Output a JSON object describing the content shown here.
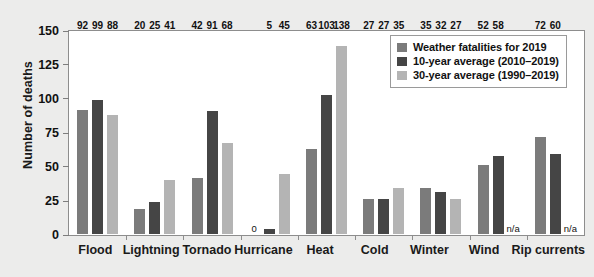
{
  "chart_data": {
    "type": "bar",
    "title": "",
    "xlabel": "",
    "ylabel": "Number of deaths",
    "ylim": [
      0,
      150
    ],
    "yticks": [
      0,
      25,
      50,
      75,
      100,
      125,
      150
    ],
    "grid": false,
    "legend_position": "top-right",
    "categories": [
      "Flood",
      "Lightning",
      "Tornado",
      "Hurricane",
      "Heat",
      "Cold",
      "Winter",
      "Wind",
      "Rip currents"
    ],
    "series": [
      {
        "name": "Weather fatalities for 2019",
        "color": "#7b7b7b",
        "values": [
          92,
          20,
          42,
          0,
          63,
          27,
          35,
          52,
          72
        ],
        "labels": [
          "92",
          "20",
          "42",
          "0",
          "63",
          "27",
          "35",
          "52",
          "72"
        ]
      },
      {
        "name": "10-year average (2010–2019)",
        "color": "#454545",
        "values": [
          99,
          25,
          91,
          5,
          103,
          27,
          32,
          58,
          60
        ],
        "labels": [
          "99",
          "25",
          "91",
          "5",
          "103",
          "27",
          "32",
          "58",
          "60"
        ]
      },
      {
        "name": "30-year average (1990–2019)",
        "color": "#b4b4b4",
        "values": [
          88,
          41,
          68,
          45,
          138,
          35,
          27,
          null,
          null
        ],
        "labels": [
          "88",
          "41",
          "68",
          "45",
          "138",
          "35",
          "27",
          "n/a",
          "n/a"
        ]
      }
    ]
  },
  "colors": {
    "page_background": "#ececeb",
    "plot_background": "#ffffff",
    "axis": "#8d8d8d",
    "text": "#111111"
  }
}
